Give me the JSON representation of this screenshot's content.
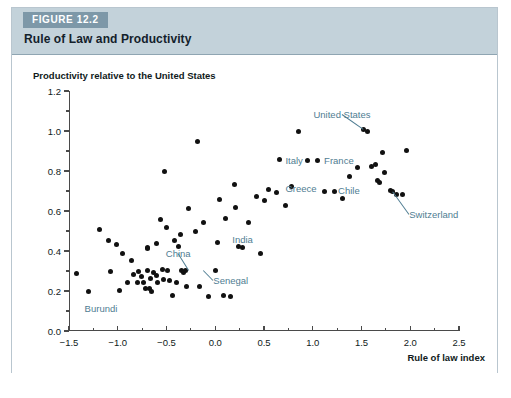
{
  "figure": {
    "tab_label": "FIGURE 12.2",
    "title": "Rule of Law and Productivity"
  },
  "colors": {
    "tab_background": "#7d98a8",
    "header_background": "#c3d2da",
    "panel_background": "#ffffff",
    "annotation_text": "#4f7d92",
    "axis": "#4a4a4a",
    "marker": "#111111",
    "frame_border": "#b9c6cf"
  },
  "chart_data": {
    "type": "scatter",
    "title": "Rule of Law and Productivity",
    "xlabel": "Rule of law index",
    "ylabel": "Productivity relative to the United States",
    "xlim": [
      -1.5,
      2.5
    ],
    "ylim": [
      0.0,
      1.2
    ],
    "xticks": [
      -1.5,
      -1.0,
      -0.5,
      0.0,
      0.5,
      1.0,
      1.5,
      2.0,
      2.5
    ],
    "xticklabels": [
      "−1.5",
      "−1.0",
      "−0.5",
      "0.0",
      "0.5",
      "1.0",
      "1.5",
      "2.0",
      "2.5"
    ],
    "x_minor_step": 0.25,
    "yticks": [
      0.0,
      0.2,
      0.4,
      0.6,
      0.8,
      1.0,
      1.2
    ],
    "yticklabels": [
      "0.0",
      "0.2",
      "0.4",
      "0.6",
      "0.8",
      "1.0",
      "1.2"
    ],
    "y_minor_step": 0.1,
    "grid": false,
    "legend": false,
    "points": [
      [
        -1.42,
        0.29
      ],
      [
        -1.3,
        0.2
      ],
      [
        -1.19,
        0.51
      ],
      [
        -1.1,
        0.455
      ],
      [
        -1.07,
        0.3
      ],
      [
        -1.01,
        0.435
      ],
      [
        -0.98,
        0.205
      ],
      [
        -0.95,
        0.39
      ],
      [
        -0.9,
        0.245
      ],
      [
        -0.86,
        0.355
      ],
      [
        -0.84,
        0.285
      ],
      [
        -0.8,
        0.245
      ],
      [
        -0.79,
        0.3
      ],
      [
        -0.76,
        0.275
      ],
      [
        -0.74,
        0.245
      ],
      [
        -0.72,
        0.215
      ],
      [
        -0.7,
        0.305
      ],
      [
        -0.7,
        0.42
      ],
      [
        -0.695,
        0.415
      ],
      [
        -0.67,
        0.215
      ],
      [
        -0.66,
        0.265
      ],
      [
        -0.65,
        0.2
      ],
      [
        -0.63,
        0.295
      ],
      [
        -0.6,
        0.44
      ],
      [
        -0.6,
        0.28
      ],
      [
        -0.59,
        0.245
      ],
      [
        -0.56,
        0.56
      ],
      [
        -0.54,
        0.31
      ],
      [
        -0.53,
        0.26
      ],
      [
        -0.52,
        0.8
      ],
      [
        -0.5,
        0.52
      ],
      [
        -0.49,
        0.305
      ],
      [
        -0.47,
        0.255
      ],
      [
        -0.44,
        0.18
      ],
      [
        -0.42,
        0.455
      ],
      [
        -0.4,
        0.245
      ],
      [
        -0.38,
        0.425
      ],
      [
        -0.36,
        0.485
      ],
      [
        -0.35,
        0.305
      ],
      [
        -0.33,
        0.295
      ],
      [
        -0.31,
        0.305
      ],
      [
        -0.3,
        0.225
      ],
      [
        -0.27,
        0.615
      ],
      [
        -0.2,
        0.5
      ],
      [
        -0.18,
        0.95
      ],
      [
        -0.16,
        0.225
      ],
      [
        -0.12,
        0.545
      ],
      [
        -0.07,
        0.175
      ],
      [
        0.0,
        0.305
      ],
      [
        0.02,
        0.445
      ],
      [
        0.04,
        0.66
      ],
      [
        0.08,
        0.18
      ],
      [
        0.1,
        0.565
      ],
      [
        0.16,
        0.175
      ],
      [
        0.2,
        0.735
      ],
      [
        0.21,
        0.62
      ],
      [
        0.24,
        0.425
      ],
      [
        0.28,
        0.42
      ],
      [
        0.34,
        0.545
      ],
      [
        0.42,
        0.675
      ],
      [
        0.46,
        0.39
      ],
      [
        0.5,
        0.655
      ],
      [
        0.55,
        0.71
      ],
      [
        0.63,
        0.695
      ],
      [
        0.66,
        0.86
      ],
      [
        0.72,
        0.63
      ],
      [
        0.78,
        0.725
      ],
      [
        0.85,
        1.0
      ],
      [
        0.95,
        0.855
      ],
      [
        1.05,
        0.855
      ],
      [
        1.12,
        0.7
      ],
      [
        1.22,
        0.7
      ],
      [
        1.3,
        0.665
      ],
      [
        1.38,
        0.775
      ],
      [
        1.46,
        0.82
      ],
      [
        1.52,
        1.01
      ],
      [
        1.56,
        1.0
      ],
      [
        1.6,
        0.825
      ],
      [
        1.64,
        0.835
      ],
      [
        1.66,
        0.755
      ],
      [
        1.68,
        0.745
      ],
      [
        1.72,
        0.895
      ],
      [
        1.74,
        0.795
      ],
      [
        1.8,
        0.705
      ],
      [
        1.82,
        0.7
      ],
      [
        1.86,
        0.685
      ],
      [
        1.92,
        0.685
      ],
      [
        1.96,
        0.905
      ]
    ],
    "annotations": [
      {
        "label": "United States",
        "x": 1.3,
        "y": 1.085,
        "anchor": "mid",
        "leader_to": [
          1.52,
          1.01
        ]
      },
      {
        "label": "France",
        "x": 1.42,
        "y": 0.855,
        "anchor": "end",
        "leader_to": null
      },
      {
        "label": "Italy",
        "x": 0.72,
        "y": 0.855,
        "anchor": "start",
        "leader_to": null
      },
      {
        "label": "Greece",
        "x": 1.04,
        "y": 0.715,
        "anchor": "end",
        "leader_to": null
      },
      {
        "label": "Chile",
        "x": 1.26,
        "y": 0.705,
        "anchor": "start",
        "leader_to": null
      },
      {
        "label": "Switzerland",
        "x": 1.99,
        "y": 0.585,
        "anchor": "start",
        "leader_to": [
          1.82,
          0.7
        ]
      },
      {
        "label": "India",
        "x": 0.28,
        "y": 0.46,
        "anchor": "mid",
        "leader_to": null
      },
      {
        "label": "China",
        "x": -0.38,
        "y": 0.39,
        "anchor": "mid",
        "leader_to": [
          -0.27,
          0.305
        ]
      },
      {
        "label": "Senegal",
        "x": -0.02,
        "y": 0.255,
        "anchor": "start",
        "leader_to": [
          -0.12,
          0.305
        ]
      },
      {
        "label": "Burundi",
        "x": -1.34,
        "y": 0.115,
        "anchor": "start",
        "leader_to": null
      }
    ]
  }
}
